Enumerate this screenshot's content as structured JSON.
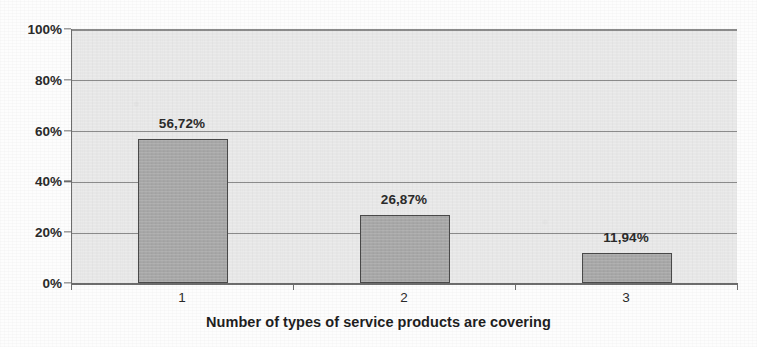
{
  "chart_data": {
    "type": "bar",
    "title": "",
    "subtitle": "",
    "xlabel": "Number of types of service products are covering",
    "ylabel": "",
    "categories": [
      "1",
      "2",
      "3"
    ],
    "values": [
      56.72,
      26.87,
      11.94
    ],
    "data_labels": [
      "56,72%",
      "26,87%",
      "11,94%"
    ],
    "ylim": [
      0,
      100
    ],
    "ytick_labels": [
      "0%",
      "20%",
      "40%",
      "60%",
      "80%",
      "100%"
    ],
    "ytick_values": [
      0,
      20,
      40,
      60,
      80,
      100
    ],
    "grid": true,
    "legend": false,
    "legend_position": "none",
    "decimal_separator": ",",
    "series": [
      {
        "name": "Share of respondents",
        "values": [
          56.72,
          26.87,
          11.94
        ]
      }
    ],
    "colors": {
      "bar_fill": "#a9a9a9",
      "bar_border": "#4a4a4a",
      "plot_background": "#ebebeb",
      "gridline": "#8b8b8b",
      "axis": "#6d6d6d",
      "text": "#2b2b2b"
    }
  }
}
